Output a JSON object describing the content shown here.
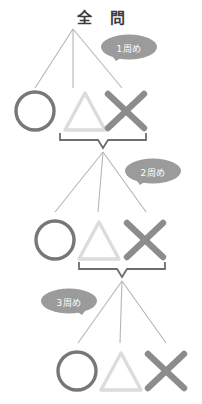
{
  "page": {
    "title": "全 問",
    "background_color": "#ffffff"
  },
  "colors": {
    "title_text": "#3b3b3b",
    "bubble_fill": "#9b9b9b",
    "bubble_text": "#ffffff",
    "branch_line": "#b5b5b5",
    "brace_line": "#6e6e6e",
    "circle_symbol": "#777777",
    "triangle_symbol": "#dcdcdc",
    "cross_symbol": "#8c8c8c"
  },
  "bubbles": [
    {
      "id": "bubble-1",
      "label": "1周め",
      "tail": "down-left"
    },
    {
      "id": "bubble-2",
      "label": "2周め",
      "tail": "down-left"
    },
    {
      "id": "bubble-3",
      "label": "3周め",
      "tail": "down-right"
    }
  ],
  "levels": [
    {
      "round_label": "1周め",
      "source_label": "全 問",
      "symbols": [
        {
          "name": "circle",
          "glyph": "○",
          "meaning": "correct"
        },
        {
          "name": "triangle",
          "glyph": "△",
          "meaning": "partial"
        },
        {
          "name": "cross",
          "glyph": "✕",
          "meaning": "incorrect"
        }
      ],
      "brace_groups": [
        "triangle",
        "cross"
      ]
    },
    {
      "round_label": "2周め",
      "source_label": "",
      "symbols": [
        {
          "name": "circle",
          "glyph": "○",
          "meaning": "correct"
        },
        {
          "name": "triangle",
          "glyph": "△",
          "meaning": "partial"
        },
        {
          "name": "cross",
          "glyph": "✕",
          "meaning": "incorrect"
        }
      ],
      "brace_groups": [
        "triangle",
        "cross"
      ]
    },
    {
      "round_label": "3周め",
      "source_label": "",
      "symbols": [
        {
          "name": "circle",
          "glyph": "○",
          "meaning": "correct"
        },
        {
          "name": "triangle",
          "glyph": "△",
          "meaning": "partial"
        },
        {
          "name": "cross",
          "glyph": "✕",
          "meaning": "incorrect"
        }
      ],
      "brace_groups": []
    }
  ]
}
